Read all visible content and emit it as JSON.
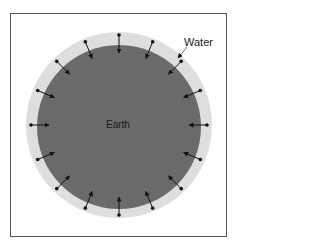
{
  "diagram": {
    "labels": {
      "earth": "Earth",
      "water": "Water"
    },
    "colors": {
      "earth_fill": "#6a6a6a",
      "water_fill": "#dedede",
      "arrow": "#111111",
      "frame": "#555555"
    },
    "arrow_count": 16
  }
}
